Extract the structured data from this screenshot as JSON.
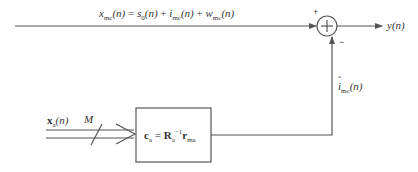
{
  "diagram": {
    "type": "block-diagram",
    "colors": {
      "line": "#555555",
      "text": "#333333",
      "background": "#ffffff"
    },
    "top_signal": {
      "label_var": "x",
      "label_sub": "mc",
      "label_arg": "(n)",
      "eq": " = ",
      "term1_var": "s",
      "term1_sub": "0",
      "term1_arg": "(n)",
      "plus1": " + ",
      "term2_var": "i",
      "term2_sub": "mc",
      "term2_arg": "(n)",
      "plus2": " + ",
      "term3_var": "w",
      "term3_sub": "mc",
      "term3_arg": "(n)"
    },
    "summing_junction": {
      "symbol": "+",
      "plus_sign": "+",
      "minus_sign": "−"
    },
    "output": {
      "var": "y",
      "arg": "(n)"
    },
    "feedback": {
      "hat": "ˆ",
      "var": "i",
      "sub": "mc",
      "arg": "(n)"
    },
    "input": {
      "var": "x",
      "sub": "a",
      "arg": "(n)",
      "bus_width": "M"
    },
    "block": {
      "lhs": "c",
      "lhs_sub": "a",
      "eq": " = ",
      "mat": "R",
      "mat_sub": "a",
      "mat_sup": "−1",
      "vec": "r",
      "vec_sub": "ma"
    }
  }
}
